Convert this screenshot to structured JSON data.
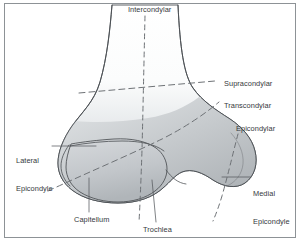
{
  "figure": {
    "view": "anterior",
    "frame_color": "#8d9296",
    "background_color": "#ffffff",
    "bone_outline_color": "#4a4e52",
    "bone_fill_light": "#ffffff",
    "bone_fill_mid": "#d3d6d9",
    "bone_fill_dark": "#a9aeb2",
    "dashed_line_color": "#6e7276",
    "leader_line_color": "#55595d",
    "label_color": "#35393d"
  },
  "plane_labels": [
    {
      "id": "intercondylar",
      "text": "Intercondylar",
      "x": 128,
      "y": 5,
      "orientation": "vertical",
      "line_style": "dashed"
    },
    {
      "id": "supracondylar",
      "text": "Supracondylar",
      "x": 224,
      "y": 79,
      "orientation": "horizontal",
      "line_style": "dashed"
    },
    {
      "id": "transcondylar",
      "text": "Transcondylar",
      "x": 224,
      "y": 101,
      "orientation": "oblique",
      "line_style": "dashed"
    },
    {
      "id": "epicondylar",
      "text": "Epicondylar",
      "x": 236,
      "y": 124,
      "orientation": "steep-oblique",
      "line_style": "dashed"
    }
  ],
  "anatomy_labels": [
    {
      "id": "lateral-epicondyle",
      "line1": "Lateral",
      "line2": "Epicondyle",
      "x": 16,
      "y": 139,
      "align": "left",
      "leader": "horizontal"
    },
    {
      "id": "medial-epicondyle",
      "line1": "Medial",
      "line2": "Epicondyle",
      "x": 253,
      "y": 172,
      "align": "left",
      "leader": "horizontal"
    },
    {
      "id": "capitellum",
      "line1": "Capitellum",
      "line2": "",
      "x": 75,
      "y": 217,
      "align": "left",
      "leader": "vertical"
    },
    {
      "id": "trochlea",
      "line1": "Trochlea",
      "line2": "",
      "x": 144,
      "y": 227,
      "align": "left",
      "leader": "vertical"
    }
  ]
}
